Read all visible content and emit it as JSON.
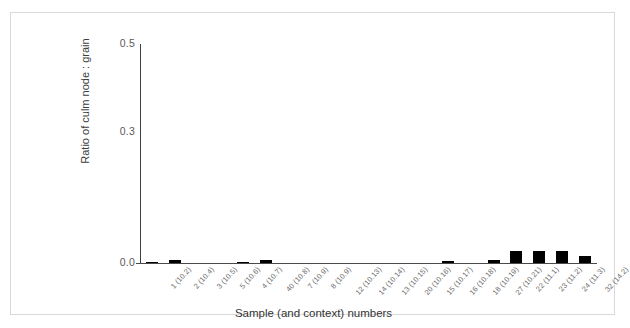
{
  "chart_data": {
    "type": "bar",
    "title": "",
    "xlabel": "Sample (and context) numbers",
    "ylabel": "Ratio of culm node : grain",
    "ylim": [
      0.0,
      0.5
    ],
    "yticks": [
      "0.0",
      "0.3",
      "0.5"
    ],
    "ytick_values": [
      0.0,
      0.3,
      0.5
    ],
    "grid": false,
    "legend": "none",
    "bar_color": "#000000",
    "axis_color": "#404040",
    "categories": [
      "1 (10.2)",
      "2 (10.4)",
      "3 (10.5)",
      "5 (10.6)",
      "4 (10.7)",
      "40 (10.8)",
      "7 (10.9)",
      "8 (10.9)",
      "12 (10.13)",
      "14 (10.14)",
      "13 (10.15)",
      "20 (10.16)",
      "15 (10.17)",
      "16 (10.18)",
      "18 (10.19)",
      "27 (10.21)",
      "22 (11.1)",
      "23 (11.2)",
      "24 (11.3)",
      "32 (14.2)"
    ],
    "values": [
      0.003,
      0.006,
      0.0,
      0.0,
      0.002,
      0.006,
      0.0,
      0.0,
      0.0,
      0.0,
      0.0,
      0.0,
      0.0,
      0.004,
      0.0,
      0.006,
      0.027,
      0.027,
      0.027,
      0.017
    ]
  },
  "figure": {
    "border_color": "#d9d9d9",
    "background": "#ffffff"
  }
}
